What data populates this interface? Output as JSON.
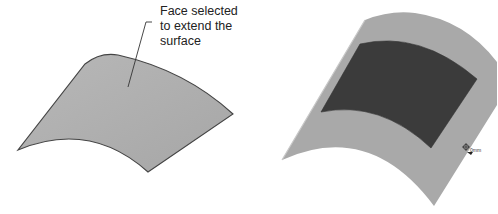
{
  "callout": {
    "lines": [
      "Face selected",
      "to extend the",
      "surface"
    ]
  },
  "cursor": {
    "label": "0mm"
  },
  "colors": {
    "surface_fill": "#b4b4b4",
    "surface_edge": "#444444",
    "selected_face": "#3c3c3c",
    "extended_surface": "#a8a8a8",
    "background": "#ffffff"
  }
}
